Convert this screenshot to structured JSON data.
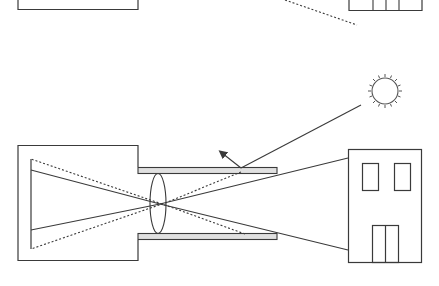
{
  "diagram": {
    "colors": {
      "stroke": "#3a3a3a",
      "barrel_fill": "#e0e0e0",
      "background": "#ffffff"
    },
    "elements": [
      "top-partial-camera-box",
      "top-partial-building",
      "top-dotted-ray",
      "sun",
      "camera-body",
      "film-plane",
      "lens-barrel-top",
      "lens-barrel-bottom",
      "lens",
      "image-rays",
      "stray-rays",
      "sun-ray",
      "reflected-ray-arrow",
      "building"
    ]
  }
}
